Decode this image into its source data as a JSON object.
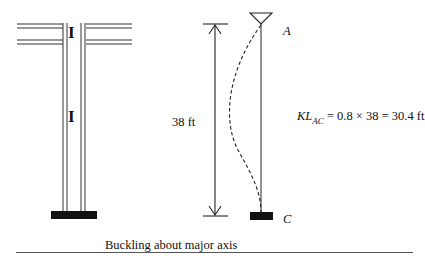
{
  "left_figure": {
    "section_symbol_top": "I",
    "section_symbol_mid": "I"
  },
  "right_figure": {
    "length_label": "38 ft",
    "top_node_label": "A",
    "bottom_node_label": "C",
    "formula": {
      "prefix": "KL",
      "subscript": "AC",
      "rest": " = 0.8 × 38 = 30.4 ft"
    }
  },
  "caption": "Buckling about major axis",
  "colors": {
    "ink": "#111111",
    "background": "#ffffff"
  }
}
